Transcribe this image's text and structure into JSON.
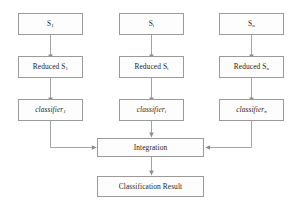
{
  "diagram": {
    "type": "flowchart",
    "stroke_color": "#8d8d8d",
    "box_fill": "#fdfdfd",
    "text_color": "#1e1e1e",
    "columns": [
      {
        "id": "column-1",
        "source": {
          "base": "S",
          "sub": "1"
        },
        "reduced": {
          "prefix": "Reduced ",
          "base": "S",
          "sub": "1"
        },
        "classifier": {
          "base": "classifier",
          "sub": "1"
        }
      },
      {
        "id": "column-i",
        "source": {
          "base": "S",
          "sub": "i"
        },
        "reduced": {
          "prefix": "Reduced ",
          "base": "S",
          "sub": "i"
        },
        "classifier": {
          "base": "classifier",
          "sub": "i"
        }
      },
      {
        "id": "column-n",
        "source": {
          "base": "S",
          "sub": "n"
        },
        "reduced": {
          "prefix": "Reduced ",
          "base": "S",
          "sub": "n"
        },
        "classifier": {
          "base": "classifier",
          "sub": "n"
        }
      }
    ],
    "integration": {
      "label": "Integration"
    },
    "result": {
      "label": "Classification Result"
    }
  }
}
